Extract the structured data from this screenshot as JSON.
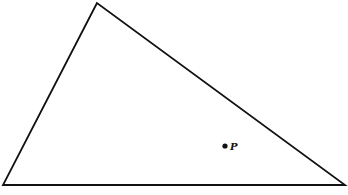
{
  "diagram": {
    "type": "triangle-with-point",
    "stroke_color": "#111111",
    "background": "#ffffff",
    "triangle": {
      "vertices": [
        {
          "x": 97,
          "y": 3
        },
        {
          "x": 3,
          "y": 185
        },
        {
          "x": 345,
          "y": 185
        }
      ]
    },
    "point": {
      "label": "P",
      "x": 225,
      "y": 146
    }
  }
}
